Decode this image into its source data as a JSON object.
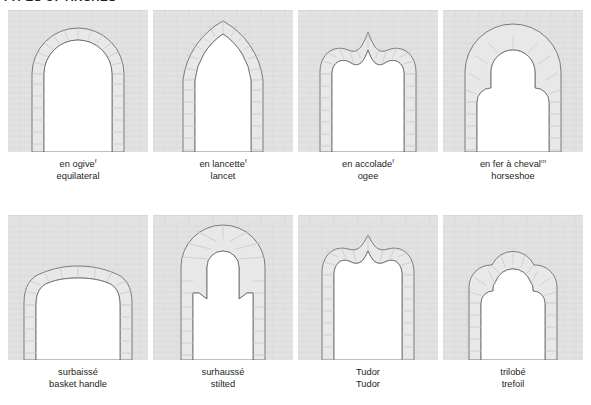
{
  "plate": {
    "title": "TYPES OF ARCHES",
    "background_color": "#ffffff",
    "masonry_color": "#e2e2e2",
    "mortar_color": "#d2d2d2",
    "voussoir_fill": "#e8e8e8",
    "opening_fill": "#ffffff",
    "outline_color": "#6e6e6e",
    "text_color": "#231f20"
  },
  "rows": [
    {
      "cells": [
        {
          "shape": "equilateral-pointed-arch",
          "french": "en ogive",
          "french_gender": "f",
          "english": "equilateral"
        },
        {
          "shape": "lancet-arch",
          "french": "en lancette",
          "french_gender": "f",
          "english": "lancet"
        },
        {
          "shape": "ogee-arch",
          "french": "en accolade",
          "french_gender": "f",
          "english": "ogee"
        },
        {
          "shape": "horseshoe-arch",
          "french": "en fer à cheval",
          "french_gender": "m",
          "english": "horseshoe"
        }
      ]
    },
    {
      "cells": [
        {
          "shape": "basket-handle-arch",
          "french": "surbaissé",
          "french_gender": "",
          "english": "basket handle"
        },
        {
          "shape": "stilted-arch",
          "french": "surhaussé",
          "french_gender": "",
          "english": "stilted"
        },
        {
          "shape": "tudor-arch",
          "french": "Tudor",
          "french_gender": "",
          "english": "Tudor"
        },
        {
          "shape": "trefoil-arch",
          "french": "trilobé",
          "french_gender": "",
          "english": "trefoil"
        }
      ]
    }
  ]
}
